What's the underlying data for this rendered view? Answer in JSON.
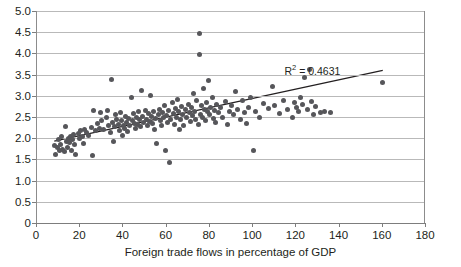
{
  "chart_data": {
    "type": "scatter",
    "title": "",
    "xlabel": "Foreign trade flows in percentage of GDP",
    "ylabel": "",
    "xlim": [
      0,
      180
    ],
    "ylim": [
      0,
      5.0
    ],
    "xticks": [
      0,
      20,
      40,
      60,
      80,
      100,
      120,
      140,
      160,
      180
    ],
    "xtick_labels": [
      "0",
      "20",
      "40",
      "60",
      "80",
      "100",
      "120",
      "140",
      "160",
      "180"
    ],
    "yticks": [
      0,
      0.5,
      1.0,
      1.5,
      2.0,
      2.5,
      3.0,
      3.5,
      4.0,
      4.5,
      5.0
    ],
    "ytick_labels": [
      "0",
      "0.5",
      "1.0",
      "1.5",
      "2.0",
      "2.5",
      "3.0",
      "3.5",
      "4.0",
      "4.5",
      "5.0"
    ],
    "grid": true,
    "legend": null,
    "point_color": "#56565a",
    "gridline_color": "#b9b9b9",
    "axis_color": "#7d7d7d",
    "trendline": {
      "annotation": "R",
      "annotation_sup": "2",
      "annotation_rest": " = 0.4631",
      "r_squared": 0.4631,
      "color": "#231f20",
      "x0": 8,
      "y0": 1.93,
      "x1": 160,
      "y1": 3.6
    },
    "points": [
      [
        8,
        1.82
      ],
      [
        8.5,
        1.61
      ],
      [
        9.5,
        1.78
      ],
      [
        10,
        1.97
      ],
      [
        10.5,
        1.72
      ],
      [
        11,
        1.86
      ],
      [
        11.5,
        2.03
      ],
      [
        12,
        1.74
      ],
      [
        12.5,
        1.69
      ],
      [
        13,
        2.28
      ],
      [
        13.5,
        1.93
      ],
      [
        14,
        1.79
      ],
      [
        14.5,
        2.0
      ],
      [
        15,
        1.9
      ],
      [
        15.5,
        2.04
      ],
      [
        16,
        1.71
      ],
      [
        16.5,
        1.98
      ],
      [
        17,
        2.08
      ],
      [
        17.5,
        1.86
      ],
      [
        18,
        1.62
      ],
      [
        19,
        2.12
      ],
      [
        19.5,
        1.99
      ],
      [
        20,
        2.17
      ],
      [
        21,
        2.05
      ],
      [
        21.5,
        1.88
      ],
      [
        22,
        2.2
      ],
      [
        23,
        2.13
      ],
      [
        24,
        2.06
      ],
      [
        25,
        2.25
      ],
      [
        25.5,
        1.6
      ],
      [
        26,
        2.66
      ],
      [
        27,
        2.19
      ],
      [
        28,
        2.34
      ],
      [
        29,
        2.23
      ],
      [
        29.5,
        2.6
      ],
      [
        30,
        2.41
      ],
      [
        31,
        2.2
      ],
      [
        32,
        2.48
      ],
      [
        32.5,
        2.66
      ],
      [
        33,
        2.3
      ],
      [
        34,
        2.13
      ],
      [
        34.5,
        3.39
      ],
      [
        35,
        2.37
      ],
      [
        35.5,
        1.93
      ],
      [
        36,
        2.27
      ],
      [
        36.5,
        2.55
      ],
      [
        37,
        2.45
      ],
      [
        37.5,
        2.33
      ],
      [
        38,
        2.19
      ],
      [
        38.5,
        2.6
      ],
      [
        39,
        2.42
      ],
      [
        39.5,
        2.07
      ],
      [
        40,
        2.31
      ],
      [
        40.5,
        2.22
      ],
      [
        41,
        2.52
      ],
      [
        41.5,
        2.38
      ],
      [
        42,
        2.16
      ],
      [
        42.5,
        2.47
      ],
      [
        43,
        2.29
      ],
      [
        43.5,
        2.95
      ],
      [
        44,
        2.41
      ],
      [
        44.5,
        2.58
      ],
      [
        45,
        2.35
      ],
      [
        45.5,
        2.24
      ],
      [
        46,
        2.49
      ],
      [
        46.5,
        2.33
      ],
      [
        47,
        2.62
      ],
      [
        47.5,
        2.44
      ],
      [
        48,
        2.27
      ],
      [
        48.5,
        3.13
      ],
      [
        49,
        2.51
      ],
      [
        49.5,
        2.36
      ],
      [
        50,
        2.66
      ],
      [
        50.5,
        2.45
      ],
      [
        51,
        2.3
      ],
      [
        51.5,
        2.58
      ],
      [
        52,
        2.4
      ],
      [
        52.5,
        3.0
      ],
      [
        53,
        2.52
      ],
      [
        53.5,
        2.35
      ],
      [
        54,
        2.63
      ],
      [
        54.5,
        2.2
      ],
      [
        55,
        2.47
      ],
      [
        55.5,
        1.88
      ],
      [
        56,
        2.55
      ],
      [
        56.5,
        2.68
      ],
      [
        57,
        2.42
      ],
      [
        57.5,
        2.31
      ],
      [
        58,
        2.6
      ],
      [
        58.5,
        2.49
      ],
      [
        59,
        2.77
      ],
      [
        59.5,
        1.7
      ],
      [
        60,
        2.54
      ],
      [
        60.5,
        2.38
      ],
      [
        61,
        2.66
      ],
      [
        61.5,
        1.43
      ],
      [
        62,
        2.45
      ],
      [
        62.5,
        2.85
      ],
      [
        63,
        2.58
      ],
      [
        63.5,
        2.33
      ],
      [
        64,
        2.7
      ],
      [
        64.5,
        2.5
      ],
      [
        65,
        2.91
      ],
      [
        65.5,
        2.62
      ],
      [
        66,
        2.2
      ],
      [
        66.5,
        2.43
      ],
      [
        67,
        2.75
      ],
      [
        67.5,
        2.55
      ],
      [
        68,
        2.3
      ],
      [
        68.5,
        2.68
      ],
      [
        69,
        2.48
      ],
      [
        70,
        2.8
      ],
      [
        70.5,
        2.6
      ],
      [
        71,
        2.39
      ],
      [
        71.5,
        2.72
      ],
      [
        72,
        2.53
      ],
      [
        72.5,
        3.05
      ],
      [
        73,
        2.64
      ],
      [
        73.5,
        2.45
      ],
      [
        74,
        2.88
      ],
      [
        74.5,
        2.33
      ],
      [
        75,
        4.47
      ],
      [
        75,
        3.97
      ],
      [
        75.5,
        2.57
      ],
      [
        76,
        2.76
      ],
      [
        76.5,
        2.5
      ],
      [
        77,
        3.18
      ],
      [
        77.5,
        2.68
      ],
      [
        78,
        2.42
      ],
      [
        78.5,
        2.84
      ],
      [
        79,
        2.62
      ],
      [
        79.5,
        3.36
      ],
      [
        80,
        2.55
      ],
      [
        80.5,
        2.73
      ],
      [
        81,
        2.95
      ],
      [
        81.5,
        2.47
      ],
      [
        82,
        2.66
      ],
      [
        82.5,
        2.38
      ],
      [
        83,
        2.8
      ],
      [
        84,
        2.6
      ],
      [
        85,
        2.72
      ],
      [
        86,
        2.5
      ],
      [
        87,
        2.86
      ],
      [
        88,
        2.32
      ],
      [
        89,
        2.64
      ],
      [
        90,
        2.78
      ],
      [
        91,
        2.55
      ],
      [
        92,
        3.1
      ],
      [
        93,
        2.67
      ],
      [
        94,
        2.44
      ],
      [
        95,
        2.88
      ],
      [
        96,
        2.6
      ],
      [
        97,
        2.34
      ],
      [
        98,
        2.73
      ],
      [
        99,
        2.96
      ],
      [
        100,
        1.72
      ],
      [
        101,
        2.62
      ],
      [
        103,
        2.5
      ],
      [
        105,
        2.82
      ],
      [
        107,
        2.69
      ],
      [
        109,
        3.21
      ],
      [
        110,
        2.76
      ],
      [
        112,
        2.58
      ],
      [
        114,
        2.9
      ],
      [
        116,
        2.67
      ],
      [
        118,
        2.48
      ],
      [
        119,
        2.85
      ],
      [
        120,
        2.72
      ],
      [
        121,
        2.63
      ],
      [
        122,
        2.95
      ],
      [
        123,
        2.8
      ],
      [
        124,
        3.44
      ],
      [
        125,
        2.68
      ],
      [
        126,
        3.62
      ],
      [
        127,
        2.86
      ],
      [
        128,
        2.55
      ],
      [
        129,
        2.74
      ],
      [
        131,
        2.6
      ],
      [
        133,
        2.62
      ],
      [
        136,
        2.6
      ],
      [
        160,
        3.31
      ]
    ]
  }
}
